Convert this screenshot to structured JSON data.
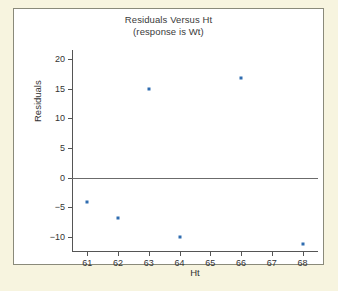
{
  "chart_data": {
    "type": "scatter",
    "title": "Residuals Versus Ht",
    "subtitle": "(response is Wt)",
    "xlabel": "Ht",
    "ylabel": "Residuals",
    "x": [
      61,
      62,
      63,
      64,
      66,
      68
    ],
    "values": [
      -4.0,
      -6.8,
      15.0,
      -10.0,
      16.8,
      -11.2
    ],
    "points": [
      {
        "x": 61,
        "y": -4.0
      },
      {
        "x": 62,
        "y": -6.8
      },
      {
        "x": 63,
        "y": 15.0
      },
      {
        "x": 64,
        "y": -10.0
      },
      {
        "x": 66,
        "y": 16.8
      },
      {
        "x": 68,
        "y": -11.2
      }
    ],
    "xticks": [
      61,
      62,
      63,
      64,
      65,
      66,
      67,
      68
    ],
    "xtick_labels": [
      "61",
      "62",
      "63",
      "64",
      "65",
      "66",
      "67",
      "68"
    ],
    "yticks": [
      20,
      15,
      10,
      5,
      0,
      -5,
      -10
    ],
    "ytick_labels": [
      "20",
      "15",
      "10",
      "5",
      "0",
      "−5",
      "−10"
    ],
    "xlim": [
      60.5,
      68.5
    ],
    "ylim": [
      -12.5,
      21.5
    ],
    "grid": false,
    "legend": null,
    "reference_line": 0,
    "marker_color": "#2f6cb0",
    "axis_color": "#555555",
    "panel_color": "#ffffff",
    "background_color": "#f7f4df"
  }
}
